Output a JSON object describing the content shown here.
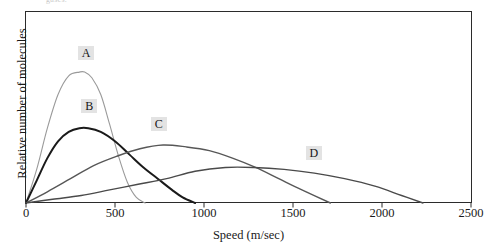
{
  "caption_sliver": "gases.",
  "axes": {
    "y_title": "Relative number of molecules",
    "x_title": "Speed (m/sec)",
    "x_ticks": [
      "0",
      "500",
      "1000",
      "1500",
      "2000",
      "2500"
    ]
  },
  "curve_labels": {
    "a": "A",
    "b": "B",
    "c": "C",
    "d": "D"
  },
  "colors": {
    "curve_a": "#9a9a9a",
    "curve_b": "#1a1a1a",
    "curve_c": "#575757",
    "curve_d": "#4a4a4a",
    "frame": "#2b2b2b",
    "label_highlight": "#e3e3e3"
  },
  "chart_data": {
    "type": "line",
    "title": "",
    "subtitle": "",
    "xlabel": "Speed (m/sec)",
    "ylabel": "Relative number of molecules",
    "xlim": [
      0,
      2500
    ],
    "ylim": [
      0,
      1.0
    ],
    "grid": false,
    "legend": "inline-labels",
    "x_ticks": [
      0,
      500,
      1000,
      1500,
      2000,
      2500
    ],
    "y_ticks": [],
    "annotations": [
      {
        "text": "A",
        "x": 330,
        "y": 0.8
      },
      {
        "text": "B",
        "x": 350,
        "y": 0.52
      },
      {
        "text": "C",
        "x": 740,
        "y": 0.42
      },
      {
        "text": "D",
        "x": 1610,
        "y": 0.27
      }
    ],
    "series": [
      {
        "name": "A",
        "color": "#9a9a9a",
        "peak_speed": 330,
        "peak_value": 0.7,
        "end_speed": 670,
        "x": [
          0,
          60,
          120,
          180,
          240,
          300,
          330,
          370,
          420,
          470,
          520,
          570,
          620,
          670
        ],
        "y": [
          0.0,
          0.18,
          0.4,
          0.58,
          0.68,
          0.7,
          0.7,
          0.67,
          0.58,
          0.42,
          0.25,
          0.11,
          0.03,
          0.0
        ]
      },
      {
        "name": "B",
        "color": "#1a1a1a",
        "peak_speed": 350,
        "peak_value": 0.4,
        "end_speed": 950,
        "x": [
          0,
          60,
          120,
          180,
          240,
          300,
          350,
          420,
          500,
          580,
          660,
          740,
          820,
          880,
          950
        ],
        "y": [
          0.0,
          0.12,
          0.24,
          0.33,
          0.38,
          0.4,
          0.4,
          0.38,
          0.33,
          0.26,
          0.19,
          0.13,
          0.07,
          0.03,
          0.0
        ]
      },
      {
        "name": "C",
        "color": "#575757",
        "peak_speed": 770,
        "peak_value": 0.31,
        "end_speed": 1710,
        "x": [
          0,
          120,
          250,
          380,
          510,
          640,
          770,
          900,
          1030,
          1160,
          1290,
          1420,
          1550,
          1710
        ],
        "y": [
          0.0,
          0.06,
          0.13,
          0.2,
          0.25,
          0.29,
          0.31,
          0.3,
          0.28,
          0.24,
          0.19,
          0.13,
          0.07,
          0.0
        ]
      },
      {
        "name": "D",
        "color": "#4a4a4a",
        "peak_speed": 1120,
        "peak_value": 0.19,
        "end_speed": 2230,
        "x": [
          0,
          150,
          310,
          470,
          630,
          790,
          950,
          1120,
          1280,
          1450,
          1620,
          1790,
          1960,
          2110,
          2230
        ],
        "y": [
          0.0,
          0.02,
          0.04,
          0.07,
          0.1,
          0.13,
          0.17,
          0.19,
          0.19,
          0.18,
          0.16,
          0.13,
          0.09,
          0.04,
          0.0
        ]
      }
    ]
  }
}
